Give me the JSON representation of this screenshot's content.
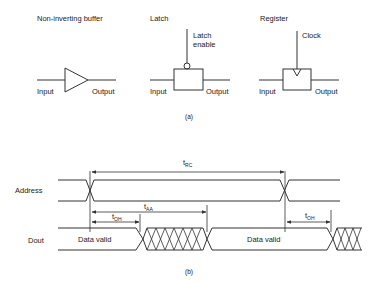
{
  "part_a": {
    "caption": "(a)",
    "buffer": {
      "title": "Non-inverting buffer",
      "input": "Input",
      "output": "Output"
    },
    "latch": {
      "title": "Latch",
      "control_line1": "Latch",
      "control_line2": "enable",
      "input": "Input",
      "output": "Output"
    },
    "register": {
      "title": "Register",
      "control": "Clock",
      "input": "Input",
      "output": "Output"
    }
  },
  "part_b": {
    "caption": "(b)",
    "signals": {
      "address": "Address",
      "dout": "Dout"
    },
    "timings": {
      "trc": {
        "t": "t",
        "sub": "RC"
      },
      "taa": {
        "t": "t",
        "sub": "AA"
      },
      "toh1": {
        "t": "t",
        "sub": "OH"
      },
      "toh2": {
        "t": "t",
        "sub": "OH"
      }
    },
    "dout_labels": [
      "Data valid",
      "Data valid"
    ]
  },
  "colors": {
    "line": "#333333",
    "background": "#ffffff"
  }
}
